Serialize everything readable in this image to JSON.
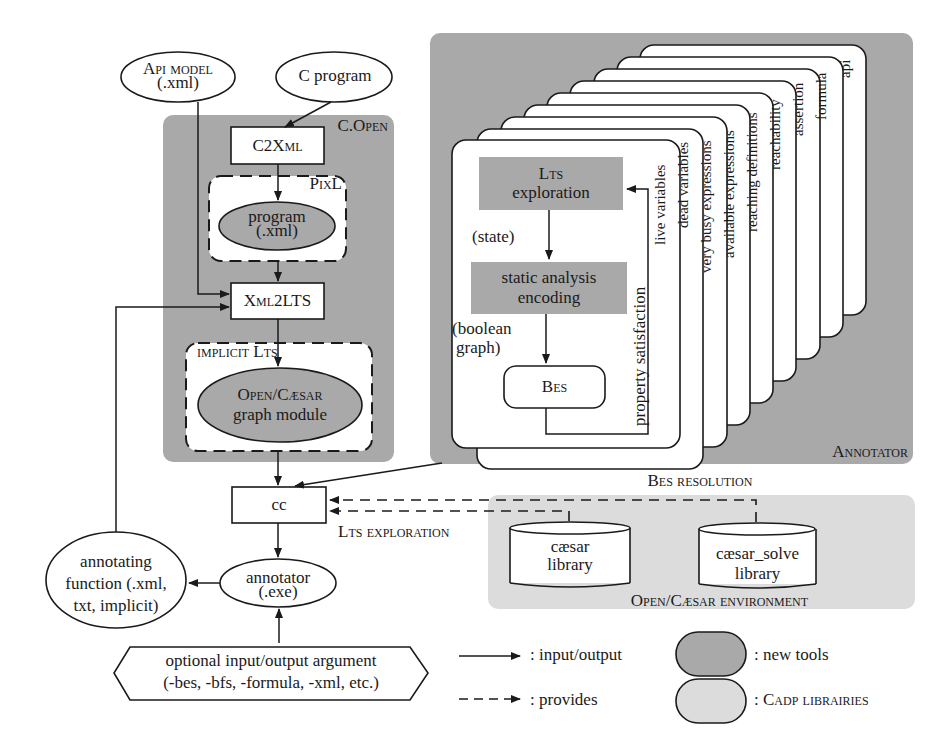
{
  "diagram": {
    "inputs": {
      "api_model": {
        "line1": "Api model",
        "line2": "(.xml)"
      },
      "c_program": {
        "label": "C program"
      }
    },
    "c_open": {
      "title": "C.Open",
      "c2xml": "C2Xml",
      "pixl": {
        "title": "PixL",
        "program_line1": "program",
        "program_line2": "(.xml)"
      },
      "xml2lts": "Xml2LTS",
      "implicit": {
        "title": "implicit Lts",
        "module_line1": "Open/Cæsar",
        "module_line2": "graph module"
      }
    },
    "annotator": {
      "title": "Annotator",
      "front_card": {
        "lts_line1": "Lts",
        "lts_line2": "exploration",
        "state_label": "(state)",
        "static_line1": "static analysis",
        "static_line2": "encoding",
        "bool_line1": "(boolean",
        "bool_line2": "graph)",
        "bes": "Bes",
        "property_label": "property satisfaction"
      },
      "cards": [
        "live variables",
        "dead variables",
        "very busy expressions",
        "available expressions",
        "reaching definitions",
        "reachability",
        "assertion",
        "formula",
        "api"
      ]
    },
    "cc": {
      "label": "cc"
    },
    "edges": {
      "bes_resolution": "Bes resolution",
      "lts_exploration": "Lts exploration"
    },
    "environment": {
      "title": "Open/Cæsar environment",
      "caesar_lib": {
        "line1": "cæsar",
        "line2": "library"
      },
      "caesar_solve_lib": {
        "line1": "cæsar_solve",
        "line2": "library"
      }
    },
    "annotator_exe": {
      "line1": "annotator",
      "line2": "(.exe)"
    },
    "annotating_function": {
      "line1": "annotating",
      "line2": "function (.xml,",
      "line3": "txt, implicit)"
    },
    "optional_args": {
      "line1": "optional input/output argument",
      "line2": "(-bes, -bfs, -formula, -xml, etc.)"
    },
    "legend": {
      "solid_arrow": ": input/output",
      "dashed_arrow": ": provides",
      "dark_shape": ": new tools",
      "light_shape": ": Cadp librairies"
    },
    "colors": {
      "dark_gray": "#a9a9a9",
      "light_gray": "#dcdcdc",
      "stroke": "#1a1a1a",
      "background": "#ffffff"
    }
  }
}
